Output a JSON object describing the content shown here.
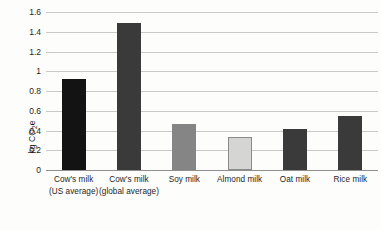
{
  "chart_data": {
    "type": "bar",
    "title": "",
    "subtitle": "",
    "xlabel": "",
    "ylabel": "kg CO2e",
    "ylabel_parts": {
      "prefix": "kg CO",
      "sub": "2",
      "suffix": "e"
    },
    "ylim": [
      0,
      1.6
    ],
    "ytick_labels": [
      "0",
      "0.2",
      "0.4",
      "0.6",
      "0.8",
      "1",
      "1.2",
      "1.4",
      "1.6"
    ],
    "ytick_values": [
      0,
      0.2,
      0.4,
      0.6,
      0.8,
      1,
      1.2,
      1.4,
      1.6
    ],
    "grid": true,
    "legend": false,
    "legend_position": "none",
    "categories": [
      "Cow's milk (US average)",
      "Cow's milk (global average)",
      "Soy milk",
      "Almond milk",
      "Oat milk",
      "Rice milk"
    ],
    "category_lines": [
      [
        "Cow's milk",
        "(US average)"
      ],
      [
        "Cow's milk",
        "(global average)"
      ],
      [
        "Soy milk",
        ""
      ],
      [
        "Almond milk",
        ""
      ],
      [
        "Oat milk",
        ""
      ],
      [
        "Rice milk",
        ""
      ]
    ],
    "values": [
      0.92,
      1.49,
      0.47,
      0.33,
      0.42,
      0.55
    ],
    "bar_colors": [
      "#131313",
      "#3a3a3a",
      "#858585",
      "#d5d5d3",
      "#3a3a3a",
      "#3a3a3a"
    ],
    "bar_edge_colors": [
      "#131313",
      "#3a3a3a",
      "#858585",
      "#8a8a88",
      "#3a3a3a",
      "#3a3a3a"
    ],
    "series": [
      {
        "name": "Greenhouse gas emissions per litre",
        "values": [
          0.92,
          1.49,
          0.47,
          0.33,
          0.42,
          0.55
        ]
      }
    ]
  },
  "colors": {
    "background": "#fdfdfc",
    "gridline": "#c9c9c7",
    "axis": "#8f8f8d",
    "text": "#1f1f1f"
  }
}
